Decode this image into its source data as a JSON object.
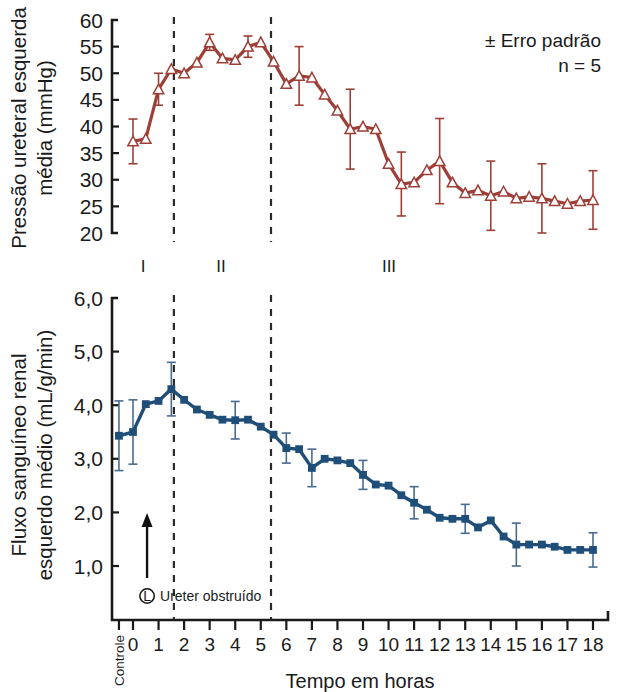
{
  "figure": {
    "background": "#ffffff",
    "legend_note_1": "± Erro padrão",
    "legend_note_2": "n = 5",
    "phase_labels": [
      "I",
      "II",
      "III"
    ],
    "annotation_symbol": "L",
    "annotation_text": "Ureter obstruído",
    "control_tick_label": "Controle"
  },
  "chart_data": [
    {
      "type": "line",
      "id": "pressure",
      "title": "",
      "ylabel": "Pressão ureteral esquerda média (mmHg)",
      "xlabel": "Tempo em horas",
      "ylim": [
        20,
        60
      ],
      "xlim": [
        -0.9,
        18.4
      ],
      "ytick_labels": [
        "20",
        "25",
        "30",
        "35",
        "40",
        "45",
        "50",
        "55",
        "60"
      ],
      "ytick_values": [
        20,
        25,
        30,
        35,
        40,
        45,
        50,
        55,
        60
      ],
      "grid": false,
      "legend_position": "top-right",
      "series_color": "#9d3f36",
      "marker": "triangle-open",
      "error_bar_label": "± Erro padrão",
      "n": 5,
      "vlines": [
        1.6,
        5.4
      ],
      "x": [
        0.0,
        0.5,
        1.0,
        1.5,
        2.0,
        2.5,
        3.0,
        3.5,
        4.0,
        4.5,
        5.0,
        5.5,
        6.0,
        6.5,
        7.0,
        7.5,
        8.0,
        8.5,
        9.0,
        9.5,
        10.0,
        10.5,
        11.0,
        11.5,
        12.0,
        12.5,
        13.0,
        13.5,
        14.0,
        14.5,
        15.0,
        15.5,
        16.0,
        16.5,
        17.0,
        17.5,
        18.0
      ],
      "y": [
        37.2,
        37.7,
        47.0,
        50.8,
        50.0,
        52.0,
        55.8,
        52.8,
        52.5,
        55.0,
        55.8,
        52.2,
        48.0,
        49.5,
        49.2,
        46.0,
        43.0,
        39.5,
        40.0,
        39.5,
        33.0,
        29.2,
        29.5,
        31.8,
        33.5,
        29.5,
        27.5,
        28.0,
        27.0,
        27.8,
        26.5,
        26.8,
        26.5,
        26.0,
        25.5,
        26.0,
        26.2
      ],
      "yerr": [
        4.2,
        0,
        3.0,
        0,
        0,
        0,
        1.5,
        0,
        0,
        2.0,
        0,
        0,
        0,
        5.5,
        0,
        0,
        0,
        7.5,
        0,
        0,
        0,
        6.0,
        0,
        0,
        8.0,
        0,
        0,
        0,
        6.5,
        0,
        0,
        0,
        6.5,
        0,
        0,
        0,
        5.5
      ]
    },
    {
      "type": "line",
      "id": "bloodflow",
      "title": "",
      "ylabel": "Fluxo sanguíneo renal esquerdo médio (mL/g/min)",
      "xlabel": "Tempo em horas",
      "ylim": [
        0.35,
        6.0
      ],
      "xlim": [
        -0.9,
        18.4
      ],
      "ytick_labels": [
        "1,0",
        "2,0",
        "3,0",
        "4,0",
        "5,0",
        "6,0"
      ],
      "ytick_values": [
        1.0,
        2.0,
        3.0,
        4.0,
        5.0,
        6.0
      ],
      "grid": false,
      "series_color": "#1f4e79",
      "marker": "square-filled",
      "n": 5,
      "vlines": [
        1.6,
        5.4
      ],
      "annotation_x": 0.55,
      "x": [
        -0.55,
        0.0,
        0.5,
        1.0,
        1.5,
        2.0,
        2.5,
        3.0,
        3.5,
        4.0,
        4.5,
        5.0,
        5.5,
        6.0,
        6.5,
        7.0,
        7.5,
        8.0,
        8.5,
        9.0,
        9.5,
        10.0,
        10.5,
        11.0,
        11.5,
        12.0,
        12.5,
        13.0,
        13.5,
        14.0,
        14.5,
        15.0,
        15.5,
        16.0,
        16.5,
        17.0,
        17.5,
        18.0
      ],
      "y": [
        3.43,
        3.5,
        4.02,
        4.08,
        4.3,
        4.1,
        3.92,
        3.82,
        3.73,
        3.72,
        3.73,
        3.6,
        3.45,
        3.2,
        3.18,
        2.83,
        3.0,
        2.97,
        2.92,
        2.7,
        2.52,
        2.5,
        2.32,
        2.18,
        2.05,
        1.9,
        1.88,
        1.88,
        1.72,
        1.85,
        1.55,
        1.4,
        1.4,
        1.4,
        1.36,
        1.3,
        1.3,
        1.3
      ],
      "yerr": [
        0.65,
        0.6,
        0,
        0,
        0.5,
        0,
        0,
        0,
        0,
        0.35,
        0,
        0,
        0,
        0.28,
        0,
        0.35,
        0,
        0,
        0,
        0.27,
        0,
        0,
        0,
        0.3,
        0,
        0,
        0,
        0.27,
        0,
        0,
        0,
        0.4,
        0,
        0,
        0,
        0,
        0,
        0.32
      ]
    }
  ],
  "xaxis": {
    "label": "Tempo em horas",
    "tick_labels": [
      "0",
      "1",
      "2",
      "3",
      "4",
      "5",
      "6",
      "7",
      "8",
      "9",
      "10",
      "11",
      "12",
      "13",
      "14",
      "15",
      "16",
      "17",
      "18"
    ],
    "tick_values": [
      0,
      1,
      2,
      3,
      4,
      5,
      6,
      7,
      8,
      9,
      10,
      11,
      12,
      13,
      14,
      15,
      16,
      17,
      18
    ],
    "control_label": "Controle",
    "control_value": -0.55
  }
}
